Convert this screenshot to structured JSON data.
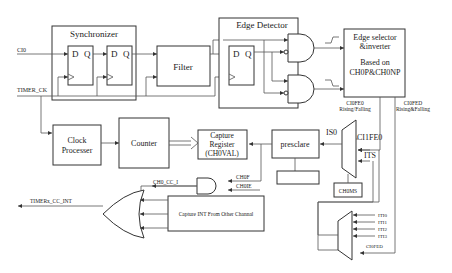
{
  "diagram": {
    "blocks": {
      "synchronizer": "Synchronizer",
      "ff_d": "D",
      "ff_q": "Q",
      "filter": "Filter",
      "edge_detector": "Edge Detector",
      "edge_selector_1": "Edge selector",
      "edge_selector_2": "&inverter",
      "edge_selector_3": "Based on",
      "edge_selector_4": "CH0P&CH0NP",
      "clock_processer_1": "Clock",
      "clock_processer_2": "Processer",
      "counter": "Counter",
      "capture_register_1": "Capture",
      "capture_register_2": "Register",
      "capture_register_3": "(CH0VAL)",
      "presclare": "presclare",
      "ch0cappsc": "CH0CAPPSC",
      "ch0ms": "CH0MS",
      "capture_int_other": "Capture INT From Other Channal"
    },
    "signals": {
      "ci0": "CI0",
      "timer_ck": "TIMER_CK",
      "ch0fe0_1": "CI0FE0",
      "ch0fe0_2": "Rising/Falling",
      "ch0fed_1": "CI0FED",
      "ch0fed_2": "Rising&Falling",
      "is0": "IS0",
      "ci1fe0": "CI1FE0",
      "its": "ITS",
      "ch0f": "CH0F",
      "ch0e": "CH0IE",
      "ch0_cc_i": "CH0_CC_I",
      "timerx_cc_int": "TIMERx_CC_INT",
      "iti0": "ITI0",
      "iti1": "ITI1",
      "iti2": "ITI2",
      "iti3": "ITI3",
      "ci0fed_mux": "CI0FED"
    },
    "colors": {
      "line": "#555555",
      "box_stroke": "#333333",
      "background": "#ffffff"
    }
  }
}
